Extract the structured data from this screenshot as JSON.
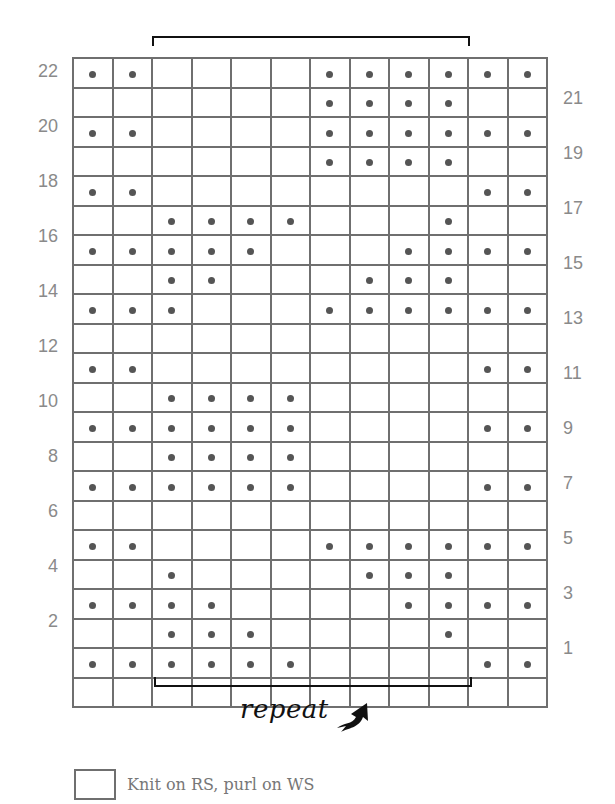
{
  "chart": {
    "columns": 12,
    "rows": 22,
    "line_color": "#6f6f6f",
    "dot_color": "#555555",
    "symbol_dot": "purl on RS, knit on WS",
    "rows_data": {
      "22": [
        1,
        1,
        0,
        0,
        0,
        0,
        1,
        1,
        1,
        1,
        1,
        1
      ],
      "21": [
        0,
        0,
        0,
        0,
        0,
        0,
        1,
        1,
        1,
        1,
        0,
        0
      ],
      "20": [
        1,
        1,
        0,
        0,
        0,
        0,
        1,
        1,
        1,
        1,
        1,
        1
      ],
      "19": [
        0,
        0,
        0,
        0,
        0,
        0,
        1,
        1,
        1,
        1,
        0,
        0
      ],
      "18": [
        1,
        1,
        0,
        0,
        0,
        0,
        0,
        0,
        0,
        0,
        1,
        1
      ],
      "17": [
        0,
        0,
        1,
        1,
        1,
        1,
        0,
        0,
        0,
        1,
        0,
        0
      ],
      "16": [
        1,
        1,
        1,
        1,
        1,
        0,
        0,
        0,
        1,
        1,
        1,
        1
      ],
      "15": [
        0,
        0,
        1,
        1,
        0,
        0,
        0,
        1,
        1,
        1,
        0,
        0
      ],
      "14": [
        1,
        1,
        1,
        0,
        0,
        0,
        1,
        1,
        1,
        1,
        1,
        1
      ],
      "13": [
        0,
        0,
        0,
        0,
        0,
        0,
        0,
        0,
        0,
        0,
        0,
        0
      ],
      "12": [
        1,
        1,
        0,
        0,
        0,
        0,
        0,
        0,
        0,
        0,
        1,
        1
      ],
      "11": [
        0,
        0,
        1,
        1,
        1,
        1,
        0,
        0,
        0,
        0,
        0,
        0
      ],
      "10": [
        1,
        1,
        1,
        1,
        1,
        1,
        0,
        0,
        0,
        0,
        1,
        1
      ],
      "9": [
        0,
        0,
        1,
        1,
        1,
        1,
        0,
        0,
        0,
        0,
        0,
        0
      ],
      "8": [
        1,
        1,
        1,
        1,
        1,
        1,
        0,
        0,
        0,
        0,
        1,
        1
      ],
      "7": [
        0,
        0,
        0,
        0,
        0,
        0,
        0,
        0,
        0,
        0,
        0,
        0
      ],
      "6": [
        1,
        1,
        0,
        0,
        0,
        0,
        1,
        1,
        1,
        1,
        1,
        1
      ],
      "5": [
        0,
        0,
        1,
        0,
        0,
        0,
        0,
        1,
        1,
        1,
        0,
        0
      ],
      "4": [
        1,
        1,
        1,
        1,
        0,
        0,
        0,
        0,
        1,
        1,
        1,
        1
      ],
      "3": [
        0,
        0,
        1,
        1,
        1,
        0,
        0,
        0,
        0,
        1,
        0,
        0
      ],
      "2": [
        1,
        1,
        1,
        1,
        1,
        1,
        0,
        0,
        0,
        0,
        1,
        1
      ],
      "1": [
        0,
        0,
        0,
        0,
        0,
        0,
        0,
        0,
        0,
        0,
        0,
        0
      ]
    },
    "left_labels": [
      "22",
      "20",
      "18",
      "16",
      "14",
      "12",
      "10",
      "8",
      "6",
      "4",
      "2"
    ],
    "right_labels": [
      "21",
      "19",
      "17",
      "15",
      "13",
      "11",
      "9",
      "7",
      "5",
      "3",
      "1"
    ],
    "repeat_columns": [
      3,
      10
    ]
  },
  "repeat": {
    "label": "repeat",
    "arrow_icon": "curved-arrow-up-right-icon"
  },
  "legend": {
    "items": [
      {
        "symbol": "empty-square",
        "label": "Knit on RS, purl on WS"
      }
    ]
  }
}
